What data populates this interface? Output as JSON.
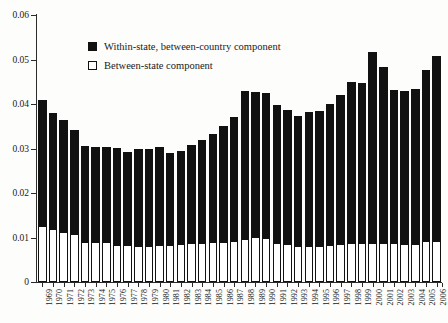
{
  "chart_data": {
    "type": "bar",
    "stacked": true,
    "title": "",
    "subtitle": "",
    "xlabel": "",
    "ylabel": "",
    "ylim": [
      0,
      0.06
    ],
    "ytick_labels": [
      "0",
      "0.01",
      "0.02",
      "0.03",
      "0.04",
      "0.05",
      "0.06"
    ],
    "ytick_values": [
      0,
      0.01,
      0.02,
      0.03,
      0.04,
      0.05,
      0.06
    ],
    "grid": false,
    "legend_position": "upper-left-inside",
    "categories": [
      "1969",
      "1970",
      "1971",
      "1972",
      "1973",
      "1974",
      "1975",
      "1976",
      "1977",
      "1978",
      "1979",
      "1980",
      "1981",
      "1982",
      "1983",
      "1984",
      "1985",
      "1986",
      "1987",
      "1988",
      "1989",
      "1990",
      "1991",
      "1992",
      "1993",
      "1994",
      "1995",
      "1996",
      "1997",
      "1998",
      "1999",
      "2000",
      "2001",
      "2002",
      "2003",
      "2004",
      "2005",
      "2006"
    ],
    "series": [
      {
        "name": "Between-state component",
        "color": "#ffffff",
        "values": [
          0.0125,
          0.012,
          0.0113,
          0.0108,
          0.0091,
          0.0091,
          0.0091,
          0.0084,
          0.0083,
          0.008,
          0.0082,
          0.0083,
          0.0084,
          0.0086,
          0.0087,
          0.0088,
          0.009,
          0.0091,
          0.0093,
          0.0097,
          0.0101,
          0.0099,
          0.0088,
          0.0086,
          0.0082,
          0.008,
          0.0082,
          0.0083,
          0.0086,
          0.0087,
          0.0087,
          0.0088,
          0.0088,
          0.0087,
          0.0086,
          0.0085,
          0.0092,
          0.0092
        ]
      },
      {
        "name": "Within-state, between-country component",
        "color": "#111111",
        "values": [
          0.0284,
          0.026,
          0.0252,
          0.0234,
          0.0214,
          0.0213,
          0.0213,
          0.0218,
          0.021,
          0.022,
          0.0217,
          0.0221,
          0.0207,
          0.0208,
          0.0222,
          0.0232,
          0.0243,
          0.0259,
          0.0278,
          0.0333,
          0.0325,
          0.0326,
          0.0309,
          0.0301,
          0.029,
          0.0301,
          0.0303,
          0.0316,
          0.0335,
          0.0363,
          0.036,
          0.043,
          0.0396,
          0.0344,
          0.0344,
          0.0349,
          0.0384,
          0.0416
        ]
      }
    ],
    "totals": [
      0.0409,
      0.038,
      0.0365,
      0.0342,
      0.0305,
      0.0304,
      0.0304,
      0.0302,
      0.0293,
      0.03,
      0.0299,
      0.0304,
      0.0291,
      0.0294,
      0.0309,
      0.032,
      0.0333,
      0.035,
      0.0371,
      0.043,
      0.0426,
      0.0425,
      0.0397,
      0.0387,
      0.0372,
      0.0381,
      0.0385,
      0.0399,
      0.0421,
      0.045,
      0.0447,
      0.0518,
      0.0484,
      0.0431,
      0.043,
      0.0434,
      0.0476,
      0.0508
    ]
  },
  "legend": {
    "items": [
      {
        "label": "Within-state, between-country component",
        "swatch": "filled-square-icon"
      },
      {
        "label": "Between-state component",
        "swatch": "hollow-square-icon"
      }
    ]
  }
}
